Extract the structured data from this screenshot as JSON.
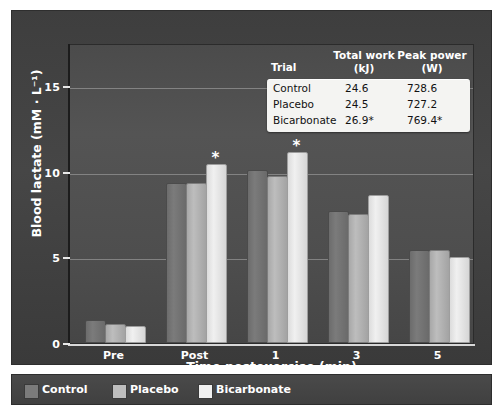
{
  "chart_data": {
    "type": "bar",
    "title": "",
    "xlabel": "Time postexercise (min)",
    "ylabel": "Blood lactate (mM · L⁻¹)",
    "categories": [
      "Pre",
      "Post",
      "1",
      "3",
      "5"
    ],
    "series": [
      {
        "name": "Control",
        "color": "#7b7b7b",
        "values": [
          1.2,
          9.2,
          10.0,
          7.6,
          5.3
        ]
      },
      {
        "name": "Placebo",
        "color": "#bdbdbd",
        "values": [
          1.0,
          9.2,
          9.6,
          7.4,
          5.3
        ]
      },
      {
        "name": "Bicarbonate",
        "color": "#f0f0f0",
        "values": [
          0.9,
          10.3,
          11.0,
          8.5,
          4.9
        ]
      }
    ],
    "annotations": [
      {
        "category": "Post",
        "series": "Bicarbonate",
        "text": "*"
      },
      {
        "category": "1",
        "series": "Bicarbonate",
        "text": "*"
      }
    ],
    "ylim": [
      0,
      17.5
    ],
    "yticks": [
      0,
      5,
      10,
      15
    ],
    "ytick_labels": [
      "0",
      "5",
      "10",
      "15"
    ],
    "grid": true,
    "legend_position": "bottom"
  },
  "inset_table": {
    "headers": {
      "trial": "Trial",
      "total_work_line1": "Total work",
      "total_work_line2": "(kJ)",
      "peak_power_line1": "Peak power",
      "peak_power_line2": "(W)"
    },
    "rows": [
      {
        "trial": "Control",
        "total_work": "24.6",
        "peak_power": "728.6"
      },
      {
        "trial": "Placebo",
        "total_work": "24.5",
        "peak_power": "727.2"
      },
      {
        "trial": "Bicarbonate",
        "total_work": "26.9*",
        "peak_power": "769.4*"
      }
    ]
  },
  "legend": {
    "items": [
      {
        "label": "Control",
        "color": "#7b7b7b"
      },
      {
        "label": "Placebo",
        "color": "#bdbdbd"
      },
      {
        "label": "Bicarbonate",
        "color": "#f0f0f0"
      }
    ]
  },
  "colors": {
    "panel_bg": "#424242",
    "plot_bg": "#4e4e4e",
    "text": "#ffffff",
    "gridline": "#8c8c8c",
    "table_bg": "#f4f4f2"
  }
}
